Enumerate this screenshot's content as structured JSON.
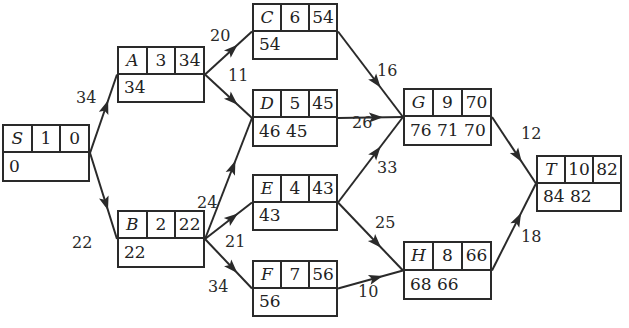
{
  "diagram": {
    "type": "activity-network",
    "nodes": [
      {
        "id": "S",
        "name": "S",
        "duration": "1",
        "value": "0",
        "bottom": "0",
        "box": [
          2,
          124,
          88,
          58
        ]
      },
      {
        "id": "A",
        "name": "A",
        "duration": "3",
        "value": "34",
        "bottom": "34",
        "box": [
          117,
          46,
          88,
          57
        ]
      },
      {
        "id": "B",
        "name": "B",
        "duration": "2",
        "value": "22",
        "bottom": "22",
        "box": [
          117,
          210,
          88,
          58
        ]
      },
      {
        "id": "C",
        "name": "C",
        "duration": "6",
        "value": "54",
        "bottom": "54",
        "box": [
          252,
          3,
          86,
          57
        ]
      },
      {
        "id": "D",
        "name": "D",
        "duration": "5",
        "value": "45",
        "bottom": "46 45",
        "box": [
          252,
          89,
          86,
          58
        ]
      },
      {
        "id": "E",
        "name": "E",
        "duration": "4",
        "value": "43",
        "bottom": "43",
        "box": [
          252,
          174,
          86,
          57
        ]
      },
      {
        "id": "F",
        "name": "F",
        "duration": "7",
        "value": "56",
        "bottom": "56",
        "box": [
          252,
          260,
          86,
          57
        ]
      },
      {
        "id": "G",
        "name": "G",
        "duration": "9",
        "value": "70",
        "bottom": "76 71 70",
        "box": [
          403,
          88,
          89,
          58
        ]
      },
      {
        "id": "H",
        "name": "H",
        "duration": "8",
        "value": "66",
        "bottom": "68 66",
        "box": [
          403,
          241,
          89,
          59
        ]
      },
      {
        "id": "T",
        "name": "T",
        "duration": "10",
        "value": "82",
        "bottom": "84 82",
        "box": [
          536,
          155,
          86,
          57
        ]
      }
    ],
    "edges": [
      {
        "from": "S",
        "to": "A",
        "weight": "34",
        "label_pos": [
          76,
          90
        ]
      },
      {
        "from": "S",
        "to": "B",
        "weight": "22",
        "label_pos": [
          72,
          235
        ]
      },
      {
        "from": "A",
        "to": "C",
        "weight": "20",
        "label_pos": [
          210,
          28
        ]
      },
      {
        "from": "A",
        "to": "D",
        "weight": "11",
        "label_pos": [
          228,
          68
        ]
      },
      {
        "from": "B",
        "to": "D",
        "weight": "24",
        "label_pos": [
          197,
          195
        ]
      },
      {
        "from": "B",
        "to": "E",
        "weight": "21",
        "label_pos": [
          225,
          234
        ]
      },
      {
        "from": "B",
        "to": "F",
        "weight": "34",
        "label_pos": [
          208,
          279
        ]
      },
      {
        "from": "C",
        "to": "G",
        "weight": "16",
        "label_pos": [
          377,
          63
        ]
      },
      {
        "from": "D",
        "to": "G",
        "weight": "26",
        "label_pos": [
          352,
          115
        ]
      },
      {
        "from": "E",
        "to": "G",
        "weight": "33",
        "label_pos": [
          377,
          160
        ]
      },
      {
        "from": "E",
        "to": "H",
        "weight": "25",
        "label_pos": [
          375,
          215
        ]
      },
      {
        "from": "F",
        "to": "H",
        "weight": "10",
        "label_pos": [
          358,
          284
        ]
      },
      {
        "from": "G",
        "to": "T",
        "weight": "12",
        "label_pos": [
          521,
          126
        ]
      },
      {
        "from": "H",
        "to": "T",
        "weight": "18",
        "label_pos": [
          521,
          229
        ]
      }
    ]
  },
  "colors": {
    "stroke": "#2a2a2a",
    "background": "#ffffff",
    "text": "#222222"
  }
}
